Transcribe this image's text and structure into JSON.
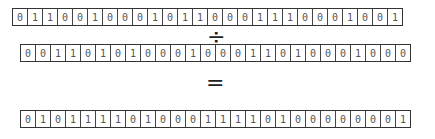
{
  "operator_divide": "÷",
  "operator_equals": "=",
  "rows": {
    "dividend": [
      "0",
      "1",
      "1",
      "0",
      "0",
      "1",
      "0",
      "0",
      "0",
      "1",
      "0",
      "1",
      "1",
      "0",
      "0",
      "0",
      "1",
      "1",
      "1",
      "0",
      "0",
      "0",
      "1",
      "0",
      "0",
      "1"
    ],
    "divisor": [
      "0",
      "0",
      "1",
      "1",
      "0",
      "1",
      "0",
      "1",
      "0",
      "0",
      "0",
      "1",
      "0",
      "0",
      "0",
      "1",
      "1",
      "0",
      "1",
      "0",
      "0",
      "0",
      "1",
      "0",
      "0",
      "0"
    ],
    "result": [
      "0",
      "1",
      "0",
      "1",
      "1",
      "1",
      "1",
      "0",
      "1",
      "0",
      "0",
      "0",
      "1",
      "1",
      "1",
      "1",
      "0",
      "1",
      "0",
      "0",
      "0",
      "0",
      "0",
      "0",
      "0",
      "1"
    ]
  }
}
